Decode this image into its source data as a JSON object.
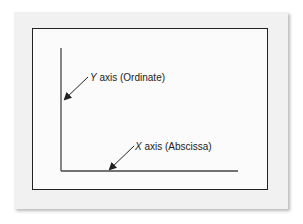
{
  "diagram": {
    "type": "coordinate-axes",
    "colors": {
      "card_background": "#f1f1f1",
      "frame_background": "#fbfbfb",
      "frame_border": "#222222",
      "axis_line": "#444444",
      "arrow": "#222222",
      "text": "#222222"
    },
    "labels": {
      "y_axis": {
        "variable": "Y",
        "text": " axis (Ordinate)"
      },
      "x_axis": {
        "variable": "X",
        "text": " axis (Abscissa)"
      }
    }
  }
}
